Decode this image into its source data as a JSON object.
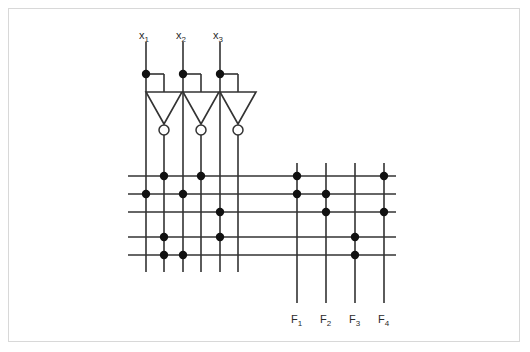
{
  "figure": {
    "kind": "pla-logic-diagram",
    "width": 530,
    "height": 352,
    "background_color": "#ffffff",
    "border_color": "#d8d8d8",
    "wire_color": "#333333",
    "dot_color": "#111111",
    "label_color": "#2b2b2b"
  },
  "inputs": [
    {
      "id": "x1",
      "label": "x",
      "sub": "1",
      "x": 146,
      "label_x": 139,
      "label_y": 30
    },
    {
      "id": "x2",
      "label": "x",
      "sub": "2",
      "x": 183,
      "label_x": 176,
      "label_y": 30
    },
    {
      "id": "x3",
      "label": "x",
      "sub": "3",
      "x": 220,
      "label_x": 213,
      "label_y": 30
    }
  ],
  "outputs": [
    {
      "id": "F1",
      "label": "F",
      "sub": "1",
      "x": 297,
      "label_x": 291,
      "label_y": 314
    },
    {
      "id": "F2",
      "label": "F",
      "sub": "2",
      "x": 326,
      "label_x": 320,
      "label_y": 314
    },
    {
      "id": "F3",
      "label": "F",
      "sub": "3",
      "x": 355,
      "label_x": 349,
      "label_y": 314
    },
    {
      "id": "F4",
      "label": "F",
      "sub": "4",
      "x": 384,
      "label_x": 378,
      "label_y": 314
    }
  ],
  "inverters": [
    {
      "id": "inv1",
      "input_tap_x": 146,
      "output_x": 164,
      "tap_y": 74,
      "top_y": 92,
      "bottom_y": 124,
      "half_width": 18,
      "bubble_cy": 130,
      "bubble_r": 5
    },
    {
      "id": "inv2",
      "input_tap_x": 183,
      "output_x": 201,
      "tap_y": 74,
      "top_y": 92,
      "bottom_y": 124,
      "half_width": 18,
      "bubble_cy": 130,
      "bubble_r": 5
    },
    {
      "id": "inv3",
      "input_tap_x": 220,
      "output_x": 238,
      "tap_y": 74,
      "top_y": 92,
      "bottom_y": 124,
      "half_width": 18,
      "bubble_cy": 130,
      "bubble_r": 5
    }
  ],
  "input_columns": [
    {
      "index": 1,
      "name": "x1",
      "x": 146,
      "y_top": 42,
      "y_bottom": 272
    },
    {
      "index": 2,
      "name": "x1-bar",
      "x": 164,
      "y_top": 135,
      "y_bottom": 272
    },
    {
      "index": 3,
      "name": "x2",
      "x": 183,
      "y_top": 42,
      "y_bottom": 272
    },
    {
      "index": 4,
      "name": "x2-bar",
      "x": 201,
      "y_top": 135,
      "y_bottom": 272
    },
    {
      "index": 5,
      "name": "x3",
      "x": 220,
      "y_top": 42,
      "y_bottom": 272
    },
    {
      "index": 6,
      "name": "x3-bar",
      "x": 238,
      "y_top": 135,
      "y_bottom": 272
    }
  ],
  "output_columns": [
    {
      "index": 1,
      "name": "F1",
      "x": 297,
      "y_top": 163,
      "y_bottom": 303
    },
    {
      "index": 2,
      "name": "F2",
      "x": 326,
      "y_top": 163,
      "y_bottom": 303
    },
    {
      "index": 3,
      "name": "F3",
      "x": 355,
      "y_top": 163,
      "y_bottom": 303
    },
    {
      "index": 4,
      "name": "F4",
      "x": 384,
      "y_top": 163,
      "y_bottom": 303
    }
  ],
  "product_rows": [
    {
      "index": 1,
      "y": 176,
      "x_left": 128,
      "x_right": 396
    },
    {
      "index": 2,
      "y": 194,
      "x_left": 128,
      "x_right": 396
    },
    {
      "index": 3,
      "y": 212,
      "x_left": 128,
      "x_right": 396
    },
    {
      "index": 4,
      "y": 237,
      "x_left": 128,
      "x_right": 396
    },
    {
      "index": 5,
      "y": 255,
      "x_left": 128,
      "x_right": 396
    }
  ],
  "and_plane_dots": [
    {
      "row": 1,
      "col": 2
    },
    {
      "row": 1,
      "col": 4
    },
    {
      "row": 2,
      "col": 1
    },
    {
      "row": 2,
      "col": 3
    },
    {
      "row": 3,
      "col": 5
    },
    {
      "row": 4,
      "col": 2
    },
    {
      "row": 4,
      "col": 5
    },
    {
      "row": 5,
      "col": 2
    },
    {
      "row": 5,
      "col": 3
    }
  ],
  "or_plane_dots": [
    {
      "row": 1,
      "col": 1
    },
    {
      "row": 1,
      "col": 4
    },
    {
      "row": 2,
      "col": 1
    },
    {
      "row": 2,
      "col": 2
    },
    {
      "row": 3,
      "col": 2
    },
    {
      "row": 3,
      "col": 4
    },
    {
      "row": 4,
      "col": 3
    },
    {
      "row": 5,
      "col": 3
    }
  ],
  "input_tap_dots": [
    {
      "x": 146,
      "y": 74
    },
    {
      "x": 183,
      "y": 74
    },
    {
      "x": 220,
      "y": 74
    }
  ],
  "dot_radius": 4.2
}
